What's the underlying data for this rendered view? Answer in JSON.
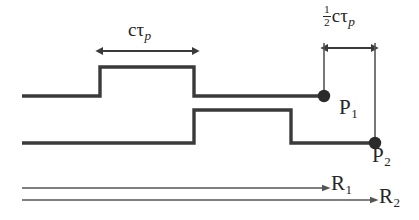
{
  "figure": {
    "background_color": "#ffffff",
    "line_color": "#3a3a3a",
    "text_color": "#262626"
  },
  "labels": {
    "pulse_width": {
      "text": "cτp",
      "c": "c",
      "tau": "τ",
      "subscript": "p"
    },
    "half_pulse_width": {
      "text": "½cτp",
      "numerator": "1",
      "denominator": "2",
      "c": "c",
      "tau": "τ",
      "subscript": "p"
    },
    "p1": {
      "base": "P",
      "subscript": "1",
      "text": "P1"
    },
    "p2": {
      "base": "P",
      "subscript": "2",
      "text": "P2"
    },
    "r1": {
      "base": "R",
      "subscript": "1",
      "text": "R1"
    },
    "r2": {
      "base": "R",
      "subscript": "2",
      "text": "R2"
    }
  },
  "geometry": {
    "canvas": {
      "width": 419,
      "height": 220
    },
    "trace_1": {
      "name": "upper-pulse-trace",
      "baseline_y": 96,
      "pulse_top_y": 67,
      "start_x": 22,
      "rise_x": 100,
      "fall_x": 194,
      "end_x": 324,
      "endpoint_marker": "P1"
    },
    "trace_2": {
      "name": "lower-pulse-trace",
      "baseline_y": 143,
      "pulse_top_y": 110,
      "start_x": 22,
      "rise_x": 194,
      "fall_x": 291,
      "end_x": 375,
      "endpoint_marker": "P2"
    },
    "pulse_width_arrow": {
      "x1": 100,
      "x2": 195,
      "y": 51,
      "double_headed": true
    },
    "half_pulse_arrow": {
      "x1": 325,
      "x2": 374,
      "y": 48,
      "double_headed": true
    },
    "tick_left": {
      "x": 324,
      "y1": 43,
      "y2": 96
    },
    "tick_right": {
      "x": 375,
      "y1": 43,
      "y2": 143
    },
    "range_arrow_1": {
      "x1": 22,
      "x2": 327,
      "y": 188,
      "label": "R1"
    },
    "range_arrow_2": {
      "x1": 22,
      "x2": 375,
      "y": 200,
      "label": "R2"
    },
    "dot_p1": {
      "cx": 324,
      "cy": 96,
      "r": 6
    },
    "dot_p2": {
      "cx": 375,
      "cy": 143,
      "r": 6
    }
  }
}
